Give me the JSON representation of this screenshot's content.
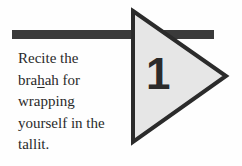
{
  "step": {
    "number": "1",
    "text_before": "Recite the bra",
    "text_underlined": "h",
    "text_after": "ah for wrapping yourself in the tallit."
  },
  "colors": {
    "bar": "#3a3a3a",
    "triangle_fill": "#e6e6e6",
    "triangle_stroke": "#2b2b2b"
  }
}
